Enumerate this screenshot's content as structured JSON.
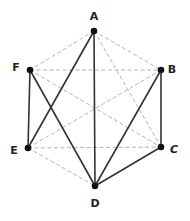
{
  "diagram": {
    "type": "graph",
    "colors": {
      "solid": "#333333",
      "dashed": "#aaaaaa",
      "vertex": "#111111",
      "background": "#ffffff"
    },
    "vertices": [
      {
        "id": "A",
        "label": "A",
        "x": 94,
        "y": 31,
        "lx": 94,
        "ly": 16,
        "italic": false
      },
      {
        "id": "B",
        "label": "B",
        "x": 161,
        "y": 70,
        "lx": 172,
        "ly": 69,
        "italic": false
      },
      {
        "id": "C",
        "label": "C",
        "x": 161,
        "y": 147,
        "lx": 174,
        "ly": 149,
        "italic": true
      },
      {
        "id": "D",
        "label": "D",
        "x": 95,
        "y": 186,
        "lx": 95,
        "ly": 203,
        "italic": false
      },
      {
        "id": "E",
        "label": "E",
        "x": 28,
        "y": 148,
        "lx": 14,
        "ly": 150,
        "italic": false
      },
      {
        "id": "F",
        "label": "F",
        "x": 30,
        "y": 70,
        "lx": 16,
        "ly": 67,
        "italic": false
      }
    ],
    "edges": [
      {
        "from": "A",
        "to": "D",
        "style": "solid"
      },
      {
        "from": "A",
        "to": "E",
        "style": "solid"
      },
      {
        "from": "F",
        "to": "E",
        "style": "solid"
      },
      {
        "from": "F",
        "to": "D",
        "style": "solid"
      },
      {
        "from": "B",
        "to": "C",
        "style": "solid"
      },
      {
        "from": "B",
        "to": "D",
        "style": "solid"
      },
      {
        "from": "C",
        "to": "D",
        "style": "solid"
      },
      {
        "from": "A",
        "to": "F",
        "style": "dashed"
      },
      {
        "from": "A",
        "to": "B",
        "style": "dashed"
      },
      {
        "from": "A",
        "to": "C",
        "style": "dashed"
      },
      {
        "from": "F",
        "to": "B",
        "style": "dashed"
      },
      {
        "from": "F",
        "to": "C",
        "style": "dashed"
      },
      {
        "from": "B",
        "to": "E",
        "style": "dashed"
      },
      {
        "from": "E",
        "to": "C",
        "style": "dashed"
      },
      {
        "from": "E",
        "to": "D",
        "style": "dashed"
      }
    ]
  }
}
